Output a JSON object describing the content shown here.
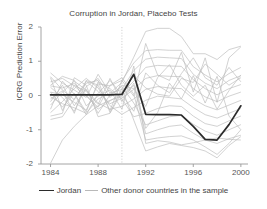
{
  "chart": {
    "title": "Corruption in Jordan, Placebo Tests",
    "ylabel": "ICRG Prediction Error",
    "xlabel": "",
    "legend": {
      "main_label": "Jordan",
      "other_label": "Other donor countries in the sample"
    }
  },
  "colors": {
    "main_line": "#2b2b2b",
    "other_line": "#bdbdbd",
    "axis": "#9a9a9a",
    "text": "#444444",
    "background": "#ffffff",
    "vline": "#c8c8c8"
  },
  "chart_data": {
    "type": "line",
    "title": "Corruption in Jordan, Placebo Tests",
    "xlabel": "",
    "ylabel": "ICRG Prediction Error",
    "xlim": [
      1983.2,
      2000.6
    ],
    "ylim": [
      -2,
      2
    ],
    "xticks": [
      1984,
      1988,
      1992,
      1996,
      2000
    ],
    "xtick_labels": [
      "1984",
      "1988",
      "1992",
      "1996",
      "2000"
    ],
    "yticks": [
      2,
      1,
      0,
      -1,
      -2
    ],
    "ytick_labels": [
      "2",
      "1",
      "0",
      "-1",
      "-2"
    ],
    "grid": false,
    "legend_position": "below",
    "annotations": [
      {
        "type": "vline",
        "x": 1990,
        "style": "dotted",
        "label": ""
      }
    ],
    "x": [
      1984,
      1985,
      1986,
      1987,
      1988,
      1989,
      1990,
      1991,
      1992,
      1993,
      1994,
      1995,
      1996,
      1997,
      1998,
      1999,
      2000
    ],
    "series": [
      {
        "name": "Jordan",
        "highlight": true,
        "values": [
          0.02,
          0.02,
          0.02,
          0.02,
          0.02,
          0.02,
          0.03,
          0.62,
          -0.55,
          -0.56,
          -0.56,
          -0.57,
          -0.9,
          -1.28,
          -1.3,
          -0.85,
          -0.3
        ]
      },
      {
        "name": "Other donor country 1",
        "highlight": false,
        "values": [
          0.66,
          0.36,
          0.16,
          -0.06,
          0.62,
          0.07,
          0.38,
          1.12,
          1.87,
          1.96,
          1.96,
          1.72,
          1.22,
          1.22,
          1.05,
          1.34,
          1.44
        ]
      },
      {
        "name": "Other donor country 2",
        "highlight": false,
        "values": [
          0.1,
          0.02,
          -0.2,
          -0.43,
          0.34,
          0.28,
          0.44,
          0.95,
          1.31,
          1.34,
          1.32,
          1.32,
          0.84,
          0.6,
          0.4,
          0.64,
          0.82
        ]
      },
      {
        "name": "Other donor country 3",
        "highlight": false,
        "values": [
          -0.04,
          -0.24,
          -0.36,
          -0.52,
          -0.1,
          0.06,
          0.18,
          0.73,
          1.06,
          1.12,
          1.1,
          1.08,
          0.62,
          0.36,
          0.2,
          0.44,
          0.58
        ]
      },
      {
        "name": "Other donor country 4",
        "highlight": false,
        "values": [
          0.28,
          0.22,
          0.35,
          0.02,
          -0.4,
          -0.16,
          0.06,
          0.42,
          0.82,
          0.88,
          0.86,
          0.85,
          0.46,
          0.2,
          0.02,
          0.2,
          0.32
        ]
      },
      {
        "name": "Other donor country 5",
        "highlight": false,
        "values": [
          0.55,
          0.16,
          -0.12,
          0.42,
          0.12,
          -0.24,
          -0.08,
          0.18,
          0.5,
          0.58,
          0.56,
          0.55,
          0.2,
          -0.04,
          -0.18,
          -0.02,
          0.1
        ]
      },
      {
        "name": "Other donor country 6",
        "highlight": false,
        "values": [
          -0.28,
          0.1,
          0.42,
          0.16,
          -0.22,
          -0.4,
          -0.32,
          -0.1,
          0.18,
          0.26,
          0.22,
          0.2,
          -0.1,
          -0.3,
          -0.42,
          -0.28,
          -0.14
        ]
      },
      {
        "name": "Other donor country 7",
        "highlight": false,
        "values": [
          -0.5,
          -0.18,
          0.2,
          0.5,
          0.22,
          -0.3,
          -0.55,
          -0.35,
          -0.14,
          -0.02,
          -0.06,
          -0.1,
          -0.35,
          -0.56,
          -0.66,
          -0.52,
          -0.38
        ]
      },
      {
        "name": "Other donor country 8",
        "highlight": false,
        "values": [
          0.1,
          -0.34,
          0.06,
          -0.48,
          0.4,
          0.2,
          -0.1,
          -0.62,
          -0.52,
          -0.38,
          -0.3,
          -0.32,
          -0.6,
          -0.82,
          -0.9,
          -0.74,
          -0.6
        ]
      },
      {
        "name": "Other donor country 9",
        "highlight": false,
        "values": [
          -0.18,
          0.3,
          -0.3,
          0.18,
          -0.52,
          0.02,
          0.26,
          -0.22,
          -0.86,
          -0.74,
          -0.62,
          -0.58,
          -0.84,
          -1.04,
          -1.16,
          -1.0,
          -0.85
        ]
      },
      {
        "name": "Other donor country 10",
        "highlight": false,
        "values": [
          -1.98,
          -1.3,
          -0.9,
          -0.56,
          -0.3,
          -0.14,
          -0.02,
          0.3,
          -1.12,
          -1.0,
          -0.9,
          -0.86,
          -1.1,
          -1.3,
          -1.4,
          -1.26,
          -1.16
        ]
      },
      {
        "name": "Other donor country 11",
        "highlight": false,
        "values": [
          0.4,
          0.5,
          0.28,
          -0.02,
          -0.34,
          0.3,
          0.52,
          0.04,
          -1.3,
          -1.24,
          -1.2,
          -1.18,
          -1.3,
          -1.5,
          -1.72,
          -1.4,
          -1.0
        ]
      },
      {
        "name": "Other donor country 12",
        "highlight": false,
        "values": [
          -0.6,
          -0.52,
          0.52,
          0.3,
          -0.62,
          -0.52,
          0.1,
          0.58,
          0.22,
          0.04,
          -0.02,
          0.5,
          0.38,
          0.92,
          0.62,
          0.3,
          0.52
        ]
      },
      {
        "name": "Other donor country 13",
        "highlight": false,
        "values": [
          0.24,
          -0.06,
          -0.46,
          0.26,
          0.5,
          -0.06,
          0.3,
          0.2,
          -0.32,
          0.52,
          0.9,
          0.3,
          -0.02,
          0.3,
          -0.4,
          0.14,
          0.6
        ]
      },
      {
        "name": "Other donor country 14",
        "highlight": false,
        "values": [
          -0.4,
          0.42,
          0.04,
          -0.56,
          0.06,
          0.44,
          0.02,
          -0.46,
          0.66,
          0.3,
          0.08,
          0.64,
          1.1,
          0.52,
          0.3,
          0.82,
          0.4
        ]
      },
      {
        "name": "Other donor country 15",
        "highlight": false,
        "values": [
          0.52,
          -0.44,
          0.3,
          0.12,
          -0.26,
          0.5,
          -0.18,
          0.36,
          -0.96,
          -0.5,
          0.36,
          -0.1,
          0.58,
          -0.22,
          0.56,
          -0.6,
          -1.0
        ]
      },
      {
        "name": "Other donor country 16",
        "highlight": false,
        "values": [
          -0.1,
          0.14,
          -0.52,
          0.44,
          0.3,
          -0.44,
          0.44,
          -0.02,
          1.52,
          0.6,
          0.44,
          1.26,
          0.1,
          1.1,
          -0.2,
          1.1,
          1.42
        ]
      },
      {
        "name": "Other donor country 17",
        "highlight": false,
        "values": [
          0.3,
          0.56,
          0.44,
          -0.3,
          -0.02,
          0.16,
          -0.4,
          0.86,
          -1.4,
          -1.32,
          -1.36,
          -1.44,
          -1.38,
          -1.3,
          -1.24,
          -1.28,
          -1.3
        ]
      },
      {
        "name": "Other donor country 18",
        "highlight": false,
        "values": [
          -0.7,
          -0.62,
          -0.1,
          0.36,
          0.44,
          -0.5,
          0.2,
          -0.72,
          -1.62,
          -1.5,
          -1.4,
          -1.46,
          -1.52,
          -1.62,
          -1.82,
          -1.46,
          -1.2
        ]
      }
    ]
  }
}
